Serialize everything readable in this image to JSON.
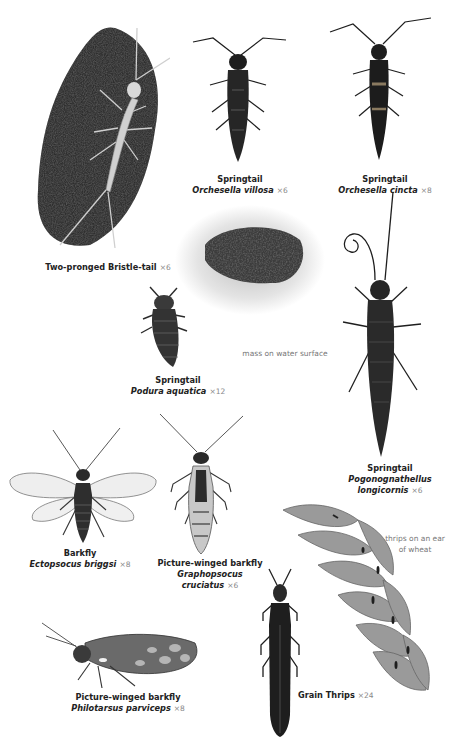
{
  "plate": {
    "specimens": [
      {
        "id": "bristletail",
        "common": "Two-pronged Bristle-tail",
        "latin": "",
        "mag": "×6"
      },
      {
        "id": "orchesella-villosa",
        "common": "Springtail",
        "latin": "Orchesella villosa",
        "mag": "×6"
      },
      {
        "id": "orchesella-cincta",
        "common": "Springtail",
        "latin": "Orchesella cincta",
        "mag": "×8"
      },
      {
        "id": "podura-aquatica",
        "common": "Springtail",
        "latin": "Podura aquatica",
        "mag": "×12"
      },
      {
        "id": "pogonognathellus",
        "common": "Springtail",
        "latin_line1": "Pogonognathellus",
        "latin_line2": "longicornis",
        "mag": "×6"
      },
      {
        "id": "ectopsocus",
        "common": "Barkfly",
        "latin": "Ectopsocus briggsi",
        "mag": "×8"
      },
      {
        "id": "graphopsocus",
        "common": "Picture-winged barkfly",
        "latin_line1": "Graphopsocus",
        "latin_line2": "cruciatus",
        "mag": "×6"
      },
      {
        "id": "philotarsus",
        "common": "Picture-winged barkfly",
        "latin": "Philotarsus parviceps",
        "mag": "×8"
      },
      {
        "id": "grain-thrips",
        "common": "Grain Thrips",
        "latin": "",
        "mag": "×24"
      }
    ],
    "notes": {
      "mass": "mass on water surface",
      "thrips_line1": "thrips on an ear",
      "thrips_line2": "of wheat"
    },
    "colors": {
      "ink": "#1e1e1e",
      "soil": "#3a3a3a",
      "wheat": "#8a8a8a",
      "caption_mag": "#888888"
    }
  }
}
